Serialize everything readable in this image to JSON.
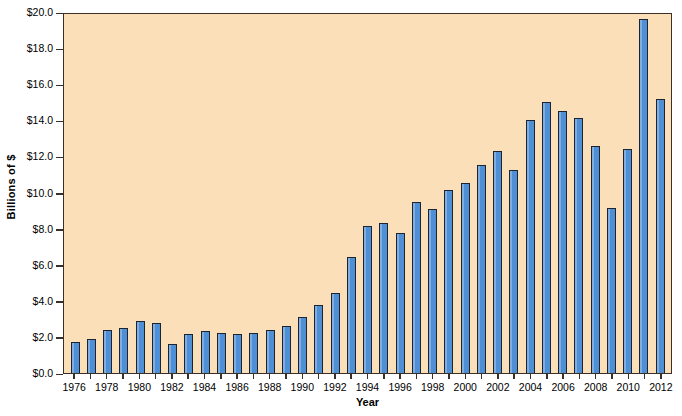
{
  "chart_data": {
    "type": "bar",
    "title": "",
    "xlabel": "Year",
    "ylabel": "Billions of $",
    "ylim": [
      0.0,
      20.0
    ],
    "ytick_step": 2.0,
    "grid": false,
    "legend": "none",
    "bar_color": "#4f8fd6",
    "bar_edge_color": "#1d2430",
    "plot_background": "#fadfb8",
    "page_background": "#ffffff",
    "ytick_labels": [
      "$20.0",
      "$18.0",
      "$16.0",
      "$14.0",
      "$12.0",
      "$10.0",
      "$8.0",
      "$6.0",
      "$4.0",
      "$2.0",
      "$0.0"
    ],
    "ytick_values": [
      20.0,
      18.0,
      16.0,
      14.0,
      12.0,
      10.0,
      8.0,
      6.0,
      4.0,
      2.0,
      0.0
    ],
    "xtick_labels": [
      "1976",
      "1978",
      "1980",
      "1982",
      "1984",
      "1986",
      "1988",
      "1990",
      "1992",
      "1994",
      "1996",
      "1998",
      "2000",
      "2002",
      "2004",
      "2006",
      "2008",
      "2010",
      "2012"
    ],
    "categories": [
      "1976",
      "1977",
      "1978",
      "1979",
      "1980",
      "1981",
      "1982",
      "1983",
      "1984",
      "1985",
      "1986",
      "1987",
      "1988",
      "1989",
      "1990",
      "1991",
      "1992",
      "1993",
      "1994",
      "1995",
      "1996",
      "1997",
      "1998",
      "1999",
      "2000",
      "2001",
      "2002",
      "2003",
      "2004",
      "2005",
      "2006",
      "2007",
      "2008",
      "2009",
      "2010",
      "2011",
      "2012"
    ],
    "values": [
      1.7,
      1.9,
      2.4,
      2.5,
      2.9,
      2.75,
      1.6,
      2.15,
      2.35,
      2.2,
      2.15,
      2.2,
      2.4,
      2.6,
      3.1,
      3.75,
      4.45,
      6.4,
      8.15,
      8.3,
      7.75,
      9.45,
      9.1,
      10.15,
      10.5,
      11.5,
      12.3,
      11.25,
      14.0,
      15.0,
      14.5,
      14.15,
      12.6,
      9.15,
      12.4,
      19.6,
      15.2
    ]
  }
}
